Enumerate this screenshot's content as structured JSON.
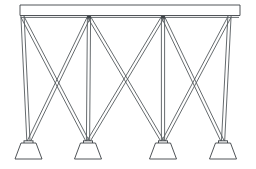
{
  "drawing": {
    "title": "Braced Trestle Tower Elevation",
    "subject": "steel-lattice-trestle",
    "view": "elevation",
    "background_color": "#ffffff",
    "line_color": "#3c4145",
    "secondary_line_color": "#555a5e",
    "canvas": {
      "width": 256,
      "height": 169
    },
    "member_style": "double-line",
    "bay_count": 3,
    "column_count": 4,
    "footing_count": 4,
    "top_beam": {
      "label": "top-chord-beam",
      "x_start": 20,
      "x_end": 240,
      "y_top": 5,
      "y_bottom": 15.5
    },
    "columns": [
      {
        "label": "column-1",
        "x_top": 22.5,
        "x_base": 28.5,
        "y_top": 15.5,
        "y_base": 143
      },
      {
        "label": "column-2",
        "x_top": 89.0,
        "x_base": 88.0,
        "y_top": 15.5,
        "y_base": 143
      },
      {
        "label": "column-3",
        "x_top": 163.0,
        "x_base": 163.0,
        "y_top": 15.5,
        "y_base": 143
      },
      {
        "label": "column-4",
        "x_top": 229.5,
        "x_base": 223.0,
        "y_top": 15.5,
        "y_base": 143
      }
    ],
    "bays": [
      {
        "label": "bay-1",
        "left_column": "column-1",
        "right_column": "column-2"
      },
      {
        "label": "bay-2",
        "left_column": "column-2",
        "right_column": "column-3"
      },
      {
        "label": "bay-3",
        "left_column": "column-3",
        "right_column": "column-4"
      }
    ],
    "footings": [
      {
        "label": "footing-1",
        "apex_x": 28.5,
        "top_y": 143,
        "base_y": 159,
        "top_half_width": 7.5,
        "base_half_width": 13.5
      },
      {
        "label": "footing-2",
        "apex_x": 88.0,
        "top_y": 143,
        "base_y": 159,
        "top_half_width": 7.5,
        "base_half_width": 13.5
      },
      {
        "label": "footing-3",
        "apex_x": 163.0,
        "top_y": 143,
        "base_y": 159,
        "top_half_width": 7.5,
        "base_half_width": 13.5
      },
      {
        "label": "footing-4",
        "apex_x": 223.0,
        "top_y": 143,
        "base_y": 159,
        "top_half_width": 7.5,
        "base_half_width": 13.5
      }
    ],
    "member_half_thickness": 1.6
  }
}
